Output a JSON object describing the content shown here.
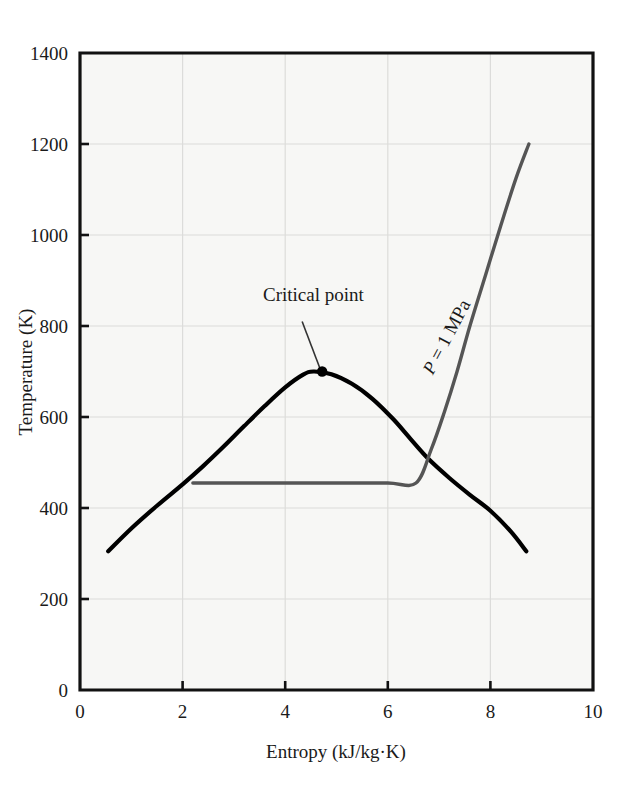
{
  "chart_data": {
    "type": "line",
    "title": "",
    "xlabel": "Entropy (kJ/kg·K)",
    "ylabel": "Temperature (K)",
    "xlim": [
      0,
      10
    ],
    "ylim": [
      0,
      1400
    ],
    "xticks": [
      0,
      2,
      4,
      6,
      8,
      10
    ],
    "xtick_labels": [
      "0",
      "2",
      "4",
      "6",
      "8",
      "10"
    ],
    "yticks": [
      0,
      200,
      400,
      600,
      800,
      1000,
      1200,
      1400
    ],
    "ytick_labels": [
      "0",
      "200",
      "400",
      "600",
      "800",
      "1000",
      "1200",
      "1400"
    ],
    "grid": true,
    "legend": "none",
    "background": "#f7f7f5",
    "series": [
      {
        "name": "saturation-dome",
        "color": "#000000",
        "width": 4.2,
        "points": [
          [
            0.55,
            305
          ],
          [
            1.0,
            355
          ],
          [
            1.5,
            405
          ],
          [
            2.0,
            452
          ],
          [
            2.4,
            492
          ],
          [
            2.8,
            535
          ],
          [
            3.2,
            580
          ],
          [
            3.6,
            624
          ],
          [
            4.0,
            665
          ],
          [
            4.35,
            693
          ],
          [
            4.55,
            700
          ],
          [
            4.9,
            694
          ],
          [
            5.3,
            673
          ],
          [
            5.7,
            640
          ],
          [
            6.1,
            596
          ],
          [
            6.45,
            551
          ],
          [
            6.8,
            507
          ],
          [
            7.2,
            466
          ],
          [
            7.6,
            429
          ],
          [
            8.0,
            394
          ],
          [
            8.4,
            348
          ],
          [
            8.7,
            305
          ]
        ]
      },
      {
        "name": "isobar-1-MPa",
        "color": "#555555",
        "width": 3.4,
        "points": [
          [
            2.2,
            455
          ],
          [
            3.0,
            455
          ],
          [
            4.0,
            455
          ],
          [
            5.0,
            455
          ],
          [
            6.0,
            455
          ],
          [
            6.55,
            455
          ],
          [
            6.85,
            530
          ],
          [
            7.1,
            610
          ],
          [
            7.35,
            700
          ],
          [
            7.6,
            800
          ],
          [
            7.9,
            910
          ],
          [
            8.2,
            1020
          ],
          [
            8.5,
            1125
          ],
          [
            8.75,
            1200
          ]
        ]
      }
    ],
    "annotations": [
      {
        "name": "critical-point",
        "label": "Critical point",
        "text_x": 4.55,
        "text_y": 855,
        "marker_x": 4.72,
        "marker_y": 700,
        "leader_from": [
          4.33,
          810
        ],
        "leader_to": [
          4.68,
          706
        ]
      },
      {
        "name": "pressure-label",
        "label": "P = 1 MPa",
        "label_parts": {
          "symbol": "P",
          "value": "= 1 MPa"
        },
        "x": 7.25,
        "y": 770,
        "rotation": -62
      }
    ]
  }
}
